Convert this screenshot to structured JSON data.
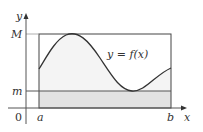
{
  "figure": {
    "type": "diagram",
    "labels": {
      "y_axis": "y",
      "x_axis": "x",
      "origin": "0",
      "max": "M",
      "min": "m",
      "left_bound": "a",
      "right_bound": "b",
      "curve": "y = f(x)"
    },
    "colors": {
      "axis": "#555555",
      "rect_outline": "#444444",
      "curve": "#333333",
      "area_under_curve": "#f4f4f4",
      "lower_rect_fill": "#e2e2e2",
      "text": "#333333"
    }
  }
}
